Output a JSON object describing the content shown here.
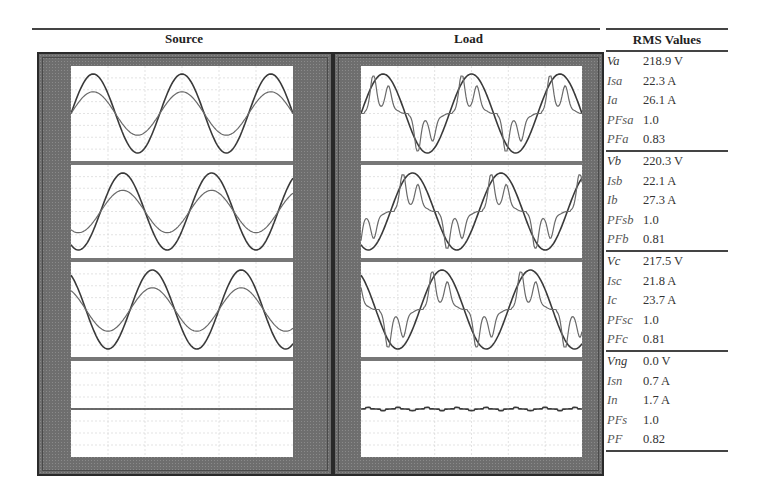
{
  "titles": {
    "source": "Source",
    "load": "Load",
    "rms": "RMS Values"
  },
  "rms_table": {
    "groups": [
      {
        "phase": "a",
        "rows": [
          {
            "label": "Va",
            "value": "218.9 V"
          },
          {
            "label": "Isa",
            "value": "22.3 A"
          },
          {
            "label": "Ia",
            "value": "26.1 A"
          },
          {
            "label": "PFsa",
            "value": "1.0"
          },
          {
            "label": "PFa",
            "value": "0.83"
          }
        ]
      },
      {
        "phase": "b",
        "rows": [
          {
            "label": "Vb",
            "value": "220.3 V"
          },
          {
            "label": "Isb",
            "value": "22.1 A"
          },
          {
            "label": "Ib",
            "value": "27.3 A"
          },
          {
            "label": "PFsb",
            "value": "1.0"
          },
          {
            "label": "PFb",
            "value": "0.81"
          }
        ]
      },
      {
        "phase": "c",
        "rows": [
          {
            "label": "Vc",
            "value": "217.5 V"
          },
          {
            "label": "Isc",
            "value": "21.8 A"
          },
          {
            "label": "Ic",
            "value": "23.7 A"
          },
          {
            "label": "PFsc",
            "value": "1.0"
          },
          {
            "label": "PFc",
            "value": "0.81"
          }
        ]
      },
      {
        "phase": "n",
        "rows": [
          {
            "label": "Vng",
            "value": "0.0 V"
          },
          {
            "label": "Isn",
            "value": "0.7 A"
          },
          {
            "label": "In",
            "value": "1.7 A"
          },
          {
            "label": "PFs",
            "value": "1.0"
          },
          {
            "label": "PF",
            "value": "0.82"
          }
        ]
      }
    ]
  },
  "colors": {
    "panel": "#6e6e6e",
    "plot_bg": "#ffffff",
    "trace_dark": "#3a3a3a",
    "trace_light": "#6a6a6a",
    "grid": "#d0d0d0",
    "separator": "#777777"
  },
  "chart_data": {
    "type": "line",
    "layout": {
      "columns": [
        "Source",
        "Load"
      ],
      "rows": [
        "phase a",
        "phase b",
        "phase c",
        "neutral"
      ],
      "grid": true,
      "cycles_shown": 2.5
    },
    "panels": [
      {
        "column": "Source",
        "row": "phase a",
        "series": [
          {
            "name": "voltage",
            "shape": "sine",
            "amplitude": 1.0,
            "phase_deg": 0
          },
          {
            "name": "source current",
            "shape": "sine",
            "amplitude": 0.55,
            "phase_deg": 0
          }
        ]
      },
      {
        "column": "Source",
        "row": "phase b",
        "series": [
          {
            "name": "voltage",
            "shape": "sine",
            "amplitude": 1.0,
            "phase_deg": -120
          },
          {
            "name": "source current",
            "shape": "sine",
            "amplitude": 0.55,
            "phase_deg": -120
          }
        ]
      },
      {
        "column": "Source",
        "row": "phase c",
        "series": [
          {
            "name": "voltage",
            "shape": "sine",
            "amplitude": 1.0,
            "phase_deg": 120
          },
          {
            "name": "source current",
            "shape": "sine",
            "amplitude": 0.55,
            "phase_deg": 120
          }
        ]
      },
      {
        "column": "Source",
        "row": "neutral",
        "series": [
          {
            "name": "neutral current",
            "shape": "flat",
            "amplitude": 0.0
          }
        ]
      },
      {
        "column": "Load",
        "row": "phase a",
        "series": [
          {
            "name": "voltage",
            "shape": "sine",
            "amplitude": 1.0,
            "phase_deg": 0
          },
          {
            "name": "load current",
            "shape": "rectifier",
            "amplitude": 0.95,
            "phase_deg": 0
          }
        ]
      },
      {
        "column": "Load",
        "row": "phase b",
        "series": [
          {
            "name": "voltage",
            "shape": "sine",
            "amplitude": 1.0,
            "phase_deg": -120
          },
          {
            "name": "load current",
            "shape": "rectifier",
            "amplitude": 0.95,
            "phase_deg": -120
          }
        ]
      },
      {
        "column": "Load",
        "row": "phase c",
        "series": [
          {
            "name": "voltage",
            "shape": "sine",
            "amplitude": 1.0,
            "phase_deg": 120
          },
          {
            "name": "load current",
            "shape": "rectifier",
            "amplitude": 0.95,
            "phase_deg": 120
          }
        ]
      },
      {
        "column": "Load",
        "row": "neutral",
        "series": [
          {
            "name": "neutral current",
            "shape": "flat_ripple",
            "amplitude": 0.04
          }
        ]
      }
    ],
    "table": {
      "header": "RMS Values",
      "rows": [
        [
          "Va",
          "218.9 V"
        ],
        [
          "Isa",
          "22.3 A"
        ],
        [
          "Ia",
          "26.1 A"
        ],
        [
          "PFsa",
          "1.0"
        ],
        [
          "PFa",
          "0.83"
        ],
        [
          "Vb",
          "220.3 V"
        ],
        [
          "Isb",
          "22.1 A"
        ],
        [
          "Ib",
          "27.3 A"
        ],
        [
          "PFsb",
          "1.0"
        ],
        [
          "PFb",
          "0.81"
        ],
        [
          "Vc",
          "217.5 V"
        ],
        [
          "Isc",
          "21.8 A"
        ],
        [
          "Ic",
          "23.7 A"
        ],
        [
          "PFsc",
          "1.0"
        ],
        [
          "PFc",
          "0.81"
        ],
        [
          "Vng",
          "0.0 V"
        ],
        [
          "Isn",
          "0.7 A"
        ],
        [
          "In",
          "1.7 A"
        ],
        [
          "PFs",
          "1.0"
        ],
        [
          "PF",
          "0.82"
        ]
      ]
    }
  }
}
